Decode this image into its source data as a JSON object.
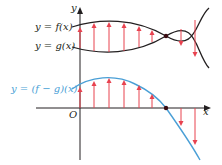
{
  "diagram": {
    "colors": {
      "curve": "#231f20",
      "difference_curve": "#4a9fd6",
      "arrows": "#e8424f",
      "axis": "#231f20",
      "difference_label": "#4a9fd6",
      "intersection_point": "#3a0c12"
    },
    "top_panel": {
      "y_axis_label": "y",
      "f_label": "y = f(x)",
      "g_label": "y = g(x)"
    },
    "bottom_panel": {
      "diff_label": "y = (f − g)(x)",
      "origin_label": "O",
      "x_axis_label": "x"
    }
  }
}
